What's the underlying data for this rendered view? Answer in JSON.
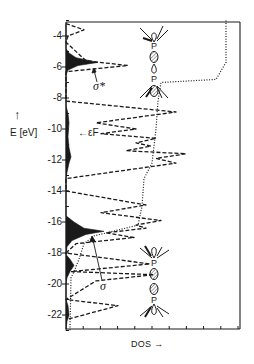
{
  "chart_data": {
    "type": "line",
    "title": "",
    "xlabel": "DOS",
    "ylabel": "E [eV]",
    "ylim": [
      -23,
      -3
    ],
    "yticks": [
      -4,
      -6,
      -8,
      -10,
      -12,
      -14,
      -16,
      -18,
      -20,
      -22
    ],
    "ytick_labels": [
      "-4",
      "-6",
      "-8",
      "-10",
      "-12",
      "-14",
      "-16",
      "-18",
      "-20",
      "-22"
    ],
    "x_minor_ticks": 10,
    "grid": false,
    "annotations": {
      "fermi": {
        "label": "εF",
        "energy": -10.3
      },
      "sigma_star": {
        "label": "σ*",
        "energy": -5.7
      },
      "sigma": {
        "label": "σ",
        "energy": -16.7
      },
      "orbital_top": {
        "label": "P",
        "description": "P–P σ* antibonding orbital sketch"
      },
      "orbital_bottom": {
        "label": "P",
        "description": "P–P σ bonding orbital sketch"
      }
    },
    "series": [
      {
        "name": "P–P projected DOS (filled)",
        "style": "filled-black",
        "points": [
          [
            -3.2,
            0
          ],
          [
            -4.8,
            0
          ],
          [
            -5.1,
            3
          ],
          [
            -5.4,
            10
          ],
          [
            -5.7,
            32
          ],
          [
            -5.9,
            12
          ],
          [
            -6.2,
            2
          ],
          [
            -6.5,
            0
          ],
          [
            -8.5,
            0
          ],
          [
            -9.0,
            2
          ],
          [
            -9.6,
            3
          ],
          [
            -10.5,
            2
          ],
          [
            -11.2,
            3
          ],
          [
            -11.8,
            5
          ],
          [
            -12.2,
            3
          ],
          [
            -12.8,
            1
          ],
          [
            -13.2,
            0
          ],
          [
            -15.6,
            0
          ],
          [
            -16.0,
            8
          ],
          [
            -16.4,
            18
          ],
          [
            -16.6,
            38
          ],
          [
            -16.8,
            20
          ],
          [
            -17.2,
            6
          ],
          [
            -17.6,
            1
          ],
          [
            -18.1,
            0
          ],
          [
            -18.4,
            4
          ],
          [
            -18.8,
            8
          ],
          [
            -19.2,
            4
          ],
          [
            -19.6,
            1
          ],
          [
            -20.0,
            0
          ],
          [
            -21.0,
            0
          ],
          [
            -21.4,
            2
          ],
          [
            -22.0,
            3
          ],
          [
            -22.4,
            1
          ],
          [
            -23,
            0
          ]
        ]
      },
      {
        "name": "Total DOS",
        "style": "dashed",
        "points": [
          [
            -3.2,
            0
          ],
          [
            -3.6,
            18
          ],
          [
            -4.0,
            2
          ],
          [
            -4.4,
            0
          ],
          [
            -5.6,
            20
          ],
          [
            -5.9,
            62
          ],
          [
            -6.3,
            0
          ],
          [
            -8.2,
            0
          ],
          [
            -8.9,
            110
          ],
          [
            -9.6,
            30
          ],
          [
            -10.0,
            70
          ],
          [
            -10.3,
            35
          ],
          [
            -10.6,
            90
          ],
          [
            -10.9,
            70
          ],
          [
            -11.1,
            85
          ],
          [
            -11.4,
            60
          ],
          [
            -11.6,
            120
          ],
          [
            -11.9,
            90
          ],
          [
            -12.2,
            110
          ],
          [
            -13.2,
            0
          ],
          [
            -14.0,
            0
          ],
          [
            -14.9,
            80
          ],
          [
            -15.4,
            35
          ],
          [
            -15.9,
            95
          ],
          [
            -16.2,
            70
          ],
          [
            -16.4,
            80
          ],
          [
            -16.7,
            40
          ],
          [
            -17.0,
            68
          ],
          [
            -17.4,
            10
          ],
          [
            -18.0,
            0
          ],
          [
            -18.7,
            84
          ],
          [
            -19.2,
            5
          ],
          [
            -19.4,
            88
          ],
          [
            -19.8,
            30
          ],
          [
            -21.0,
            0
          ],
          [
            -21.4,
            52
          ],
          [
            -22.3,
            0
          ]
        ]
      },
      {
        "name": "Integrated DOS",
        "style": "dotted",
        "points": [
          [
            -3.0,
            160
          ],
          [
            -5.7,
            160
          ],
          [
            -6.8,
            150
          ],
          [
            -7.0,
            95
          ],
          [
            -8.2,
            92
          ],
          [
            -10.0,
            90
          ],
          [
            -12.2,
            86
          ],
          [
            -13.2,
            78
          ],
          [
            -15.0,
            76
          ],
          [
            -16.2,
            72
          ],
          [
            -16.9,
            28
          ],
          [
            -17.4,
            18
          ],
          [
            -18.4,
            13
          ],
          [
            -19.2,
            8
          ],
          [
            -19.6,
            5
          ],
          [
            -23,
            4
          ]
        ]
      }
    ]
  },
  "labels": {
    "y_axis": "E [eV]",
    "y_arrow": "↑",
    "x_axis": "DOS →",
    "fermi": "←εF",
    "sigma_star": "σ*",
    "sigma": "σ",
    "ticks": [
      "-4",
      "-6",
      "-8",
      "-10",
      "-12",
      "-14",
      "-16",
      "-18",
      "-20",
      "-22"
    ]
  },
  "colors": {
    "ink": "#1a1a1a",
    "hatch": "#6a6a6a",
    "background": "#ffffff"
  }
}
